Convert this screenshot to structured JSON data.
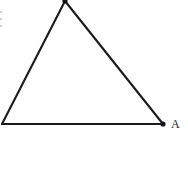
{
  "canvas": {
    "width": 188,
    "height": 172,
    "background_color": "#ffffff",
    "ink_color": "#1c1c1c"
  },
  "figure": {
    "type": "triangle-diagram",
    "stroke_width": 2.1,
    "vertices": [
      {
        "id": "apex",
        "label": "",
        "x": 65,
        "y": 0,
        "dot": true,
        "cropped": true
      },
      {
        "id": "bottom-left",
        "label": "",
        "x": 2,
        "y": 124,
        "dot": false,
        "cropped": true
      },
      {
        "id": "bottom-right",
        "label": "A",
        "x": 163,
        "y": 124,
        "dot": true,
        "cropped": false
      }
    ],
    "edges": [
      {
        "id": "left-edge",
        "from": "apex",
        "to": "bottom-left"
      },
      {
        "id": "right-edge",
        "from": "apex",
        "to": "bottom-right"
      },
      {
        "id": "bottom-edge",
        "from": "bottom-left",
        "to": "bottom-right"
      }
    ]
  },
  "labels": {
    "vertex_a": "A"
  },
  "margin_fragments": {
    "line_1": "=",
    "line_2": "=",
    "line_3": "="
  }
}
